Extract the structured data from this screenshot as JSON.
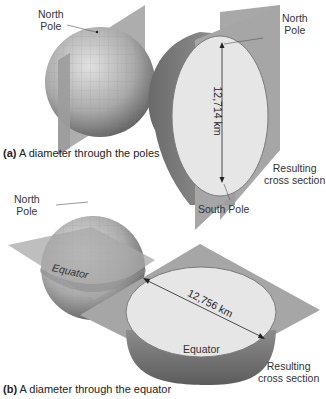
{
  "figure": {
    "panel_a": {
      "caption_letter": "(a)",
      "caption_text": " A diameter through the poles",
      "labels": {
        "north_pole_left": [
          "North",
          "Pole"
        ],
        "north_pole_right": [
          "North",
          "Pole"
        ],
        "south_pole": "South Pole",
        "resulting": [
          "Resulting",
          "cross section"
        ]
      },
      "diameter": "12,714 km"
    },
    "panel_b": {
      "caption_letter": "(b)",
      "caption_text": " A diameter through the equator",
      "labels": {
        "north_pole": [
          "North",
          "Pole"
        ],
        "equator_globe": "Equator",
        "equator_section": "Equator",
        "resulting": [
          "Resulting",
          "cross section"
        ]
      },
      "diameter": "12,756 km"
    },
    "colors": {
      "plane": "#9a9a9a",
      "globe_dark": "#6e6e6e",
      "globe_light": "#cfcfcf",
      "section_face": "#e6e6e6",
      "text": "#222222"
    }
  }
}
